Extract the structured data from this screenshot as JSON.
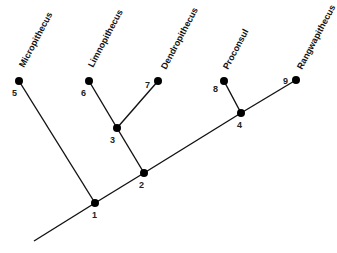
{
  "diagram": {
    "type": "cladogram",
    "taxa": [
      {
        "id": 5,
        "name": "Micropithecus"
      },
      {
        "id": 6,
        "name": "Limnopithecus"
      },
      {
        "id": 7,
        "name": "Dendropithecus"
      },
      {
        "id": 8,
        "name": "Proconsul"
      },
      {
        "id": 9,
        "name": "Rangwapithecus"
      }
    ],
    "node_labels": {
      "n1": "1",
      "n2": "2",
      "n3": "3",
      "n4": "4",
      "n5": "5",
      "n6": "6",
      "n7": "7",
      "n8": "8",
      "n9": "9"
    },
    "edges": [
      [
        "root",
        "1"
      ],
      [
        "1",
        "5"
      ],
      [
        "1",
        "2"
      ],
      [
        "2",
        "3"
      ],
      [
        "3",
        "6"
      ],
      [
        "3",
        "7"
      ],
      [
        "2",
        "4"
      ],
      [
        "4",
        "8"
      ],
      [
        "4",
        "9"
      ]
    ]
  }
}
